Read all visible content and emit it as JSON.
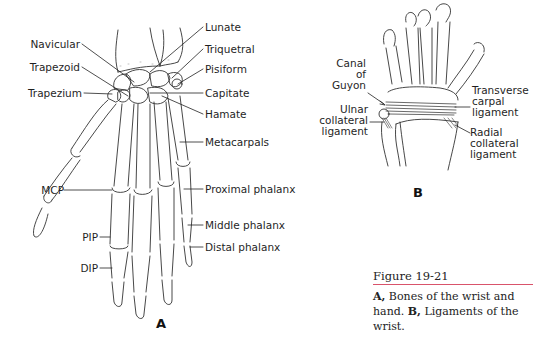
{
  "figure": {
    "number": "Figure 19-21",
    "caption": {
      "a_marker": "A,",
      "a_text": " Bones of the wrist and hand. ",
      "b_marker": "B,",
      "b_text": " Ligaments of the wrist."
    },
    "rule_color": "#d9536b"
  },
  "panel_a": {
    "letter": "A",
    "labels_left": {
      "navicular": "Navicular",
      "trapezoid": "Trapezoid",
      "trapezium": "Trapezium",
      "mcp": "MCP",
      "pip": "PIP",
      "dip": "DIP"
    },
    "labels_right": {
      "lunate": "Lunate",
      "triquetral": "Triquetral",
      "pisiform": "Pisiform",
      "capitate": "Capitate",
      "hamate": "Hamate",
      "metacarpals": "Metacarpals",
      "proximal_phalanx": "Proximal phalanx",
      "middle_phalanx": "Middle phalanx",
      "distal_phalanx": "Distal phalanx"
    }
  },
  "panel_b": {
    "letter": "B",
    "canal_of_guyon": [
      "Canal",
      "of",
      "Guyon"
    ],
    "ulnar_collateral_ligament": [
      "Ulnar",
      "collateral",
      "ligament"
    ],
    "transverse_carpal_ligament": [
      "Transverse",
      "carpal",
      "ligament"
    ],
    "radial_collateral_ligament": [
      "Radial",
      "collateral",
      "ligament"
    ]
  }
}
